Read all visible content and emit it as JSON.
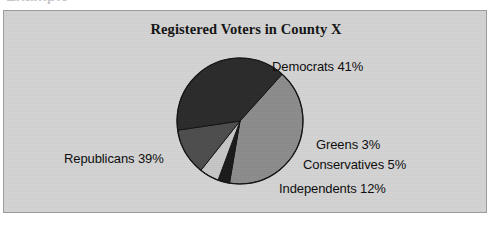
{
  "page": {
    "clipped_top_text": "Example"
  },
  "chart_panel": {
    "background_color": "#d3d3d3",
    "border_color": "#9c9c9c"
  },
  "chart_data": {
    "type": "pie",
    "title": "Registered Voters in County X",
    "xlabel": "",
    "ylabel": "",
    "legend_position": "callout-labels",
    "grid": false,
    "unit": "%",
    "categories": [
      "Democrats",
      "Greens",
      "Conservatives",
      "Independents",
      "Republicans"
    ],
    "values": [
      41,
      3,
      5,
      12,
      39
    ],
    "labels": [
      "Democrats 41%",
      "Greens 3%",
      "Conservatives 5%",
      "Independents 12%",
      "Republicans 39%"
    ],
    "colors": [
      "#8c8c8c",
      "#1a1a1a",
      "#c6c6c6",
      "#4d4d4d",
      "#2b2b2b"
    ],
    "slices": [
      {
        "name": "Democrats",
        "value": 41,
        "label": "Democrats 41%",
        "color": "#8c8c8c"
      },
      {
        "name": "Greens",
        "value": 3,
        "label": "Greens 3%",
        "color": "#1a1a1a"
      },
      {
        "name": "Conservatives",
        "value": 5,
        "label": "Conservatives 5%",
        "color": "#c6c6c6"
      },
      {
        "name": "Independents",
        "value": 12,
        "label": "Independents 12%",
        "color": "#4d4d4d"
      },
      {
        "name": "Republicans",
        "value": 39,
        "label": "Republicans 39%",
        "color": "#2b2b2b"
      }
    ],
    "total": 100,
    "geometry": {
      "center_x": 236,
      "center_y": 110,
      "radius": 63,
      "start_angle_deg": -48
    }
  }
}
